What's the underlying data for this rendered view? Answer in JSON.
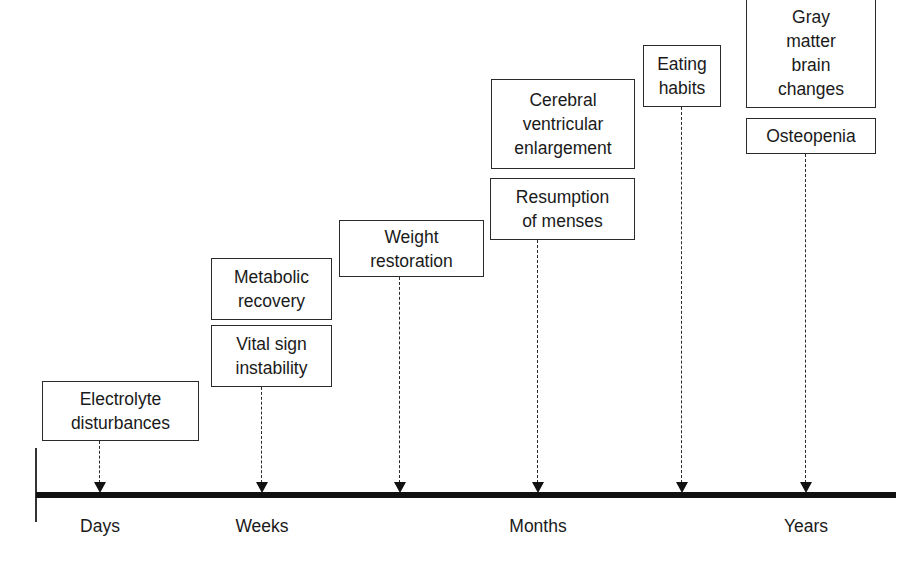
{
  "timeline": {
    "axis_labels": [
      {
        "text": "Days",
        "x": 100
      },
      {
        "text": "Weeks",
        "x": 262
      },
      {
        "text": "Months",
        "x": 538
      },
      {
        "text": "Years",
        "x": 806
      }
    ]
  },
  "events": {
    "electrolyte": {
      "lines": [
        "Electrolyte",
        "disturbances"
      ]
    },
    "metabolic": {
      "lines": [
        "Metabolic",
        "recovery"
      ]
    },
    "vital": {
      "lines": [
        "Vital sign",
        "instability"
      ]
    },
    "weight": {
      "lines": [
        "Weight",
        "restoration"
      ]
    },
    "cerebral": {
      "lines": [
        "Cerebral",
        "ventricular",
        "enlargement"
      ]
    },
    "menses": {
      "lines": [
        "Resumption",
        "of menses"
      ]
    },
    "eating": {
      "lines": [
        "Eating",
        "habits"
      ]
    },
    "gray": {
      "lines": [
        "Gray",
        "matter",
        "brain",
        "changes"
      ]
    },
    "osteopenia": {
      "lines": [
        "Osteopenia"
      ]
    }
  },
  "colors": {
    "line": "#111111",
    "box_border": "#2a2a2a",
    "background": "#ffffff"
  }
}
